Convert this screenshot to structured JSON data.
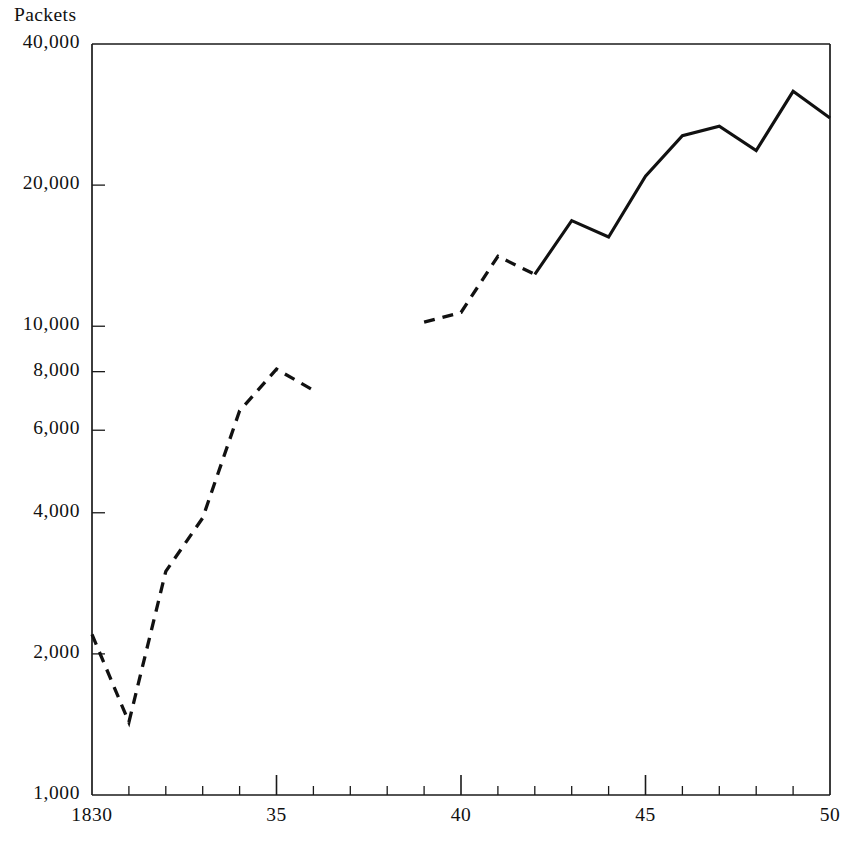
{
  "chart_data": {
    "type": "line",
    "title": "",
    "ylabel": "Packets",
    "xlabel": "",
    "y_scale": "log",
    "ylim": [
      1000,
      40000
    ],
    "xlim": [
      1830,
      1850
    ],
    "grid": false,
    "legend": "none",
    "y_tick_labels": [
      "40,000",
      "20,000",
      "10,000",
      "8,000",
      "6,000",
      "4,000",
      "2,000",
      "1,000"
    ],
    "y_tick_values": [
      40000,
      20000,
      10000,
      8000,
      6000,
      4000,
      2000,
      1000
    ],
    "x_tick_labels": [
      "1830",
      "35",
      "40",
      "45",
      "50"
    ],
    "x_tick_values": [
      1830,
      1835,
      1840,
      1845,
      1850
    ],
    "x_minor_tick_values": [
      1831,
      1832,
      1833,
      1834,
      1836,
      1837,
      1838,
      1839,
      1841,
      1842,
      1843,
      1844,
      1846,
      1847,
      1848,
      1849
    ],
    "series": [
      {
        "name": "1830-1836",
        "style": "dashed",
        "x": [
          1830,
          1831,
          1832,
          1833,
          1834,
          1835,
          1836
        ],
        "values": [
          2200,
          1430,
          3000,
          3900,
          6600,
          8100,
          7300
        ]
      },
      {
        "name": "1839-1842",
        "style": "dashed",
        "x": [
          1839,
          1840,
          1841,
          1842
        ],
        "values": [
          10200,
          10700,
          14100,
          12900
        ]
      },
      {
        "name": "1842-1850",
        "style": "solid",
        "x": [
          1842,
          1843,
          1844,
          1845,
          1846,
          1847,
          1848,
          1849,
          1850
        ],
        "values": [
          12900,
          16800,
          15500,
          20900,
          25500,
          26700,
          23700,
          31700,
          27800
        ]
      }
    ]
  },
  "axes": {
    "y_axis_label": "Packets"
  },
  "colors": {
    "ink": "#111111",
    "background": "#ffffff"
  }
}
